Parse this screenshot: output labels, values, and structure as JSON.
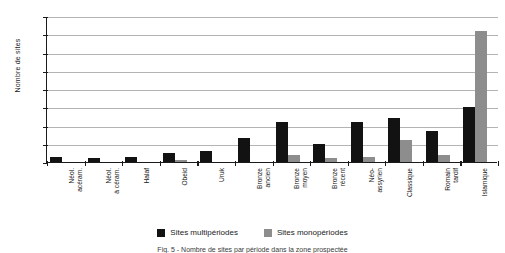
{
  "chart_data": {
    "type": "bar",
    "title": "",
    "xlabel": "",
    "ylabel": "Nombre de sites",
    "ylim": [
      0,
      80
    ],
    "ytick_step": 10,
    "yticks": [
      80,
      70,
      60,
      50,
      40,
      30,
      20,
      10,
      0
    ],
    "grid": true,
    "legend_position": "bottom",
    "categories": [
      "Néol. acéram.",
      "Néol. à céram.",
      "Halaf",
      "Obeid",
      "Uruk",
      "Bronze ancien",
      "Bronze moyen",
      "Bronze récent",
      "Néo-assyrien",
      "Classique",
      "Romain tardif",
      "Islamique"
    ],
    "category_lines": [
      [
        "Néol.",
        "acéram."
      ],
      [
        "Néol.",
        "à céram."
      ],
      [
        "Halaf"
      ],
      [
        "Obeid"
      ],
      [
        "Uruk"
      ],
      [
        "Bronze",
        "ancien"
      ],
      [
        "Bronze",
        "moyen"
      ],
      [
        "Bronze",
        "récent"
      ],
      [
        "Néo-",
        "assyrien"
      ],
      [
        "Classique"
      ],
      [
        "Romain",
        "tardif"
      ],
      [
        "Islamique"
      ]
    ],
    "series": [
      {
        "name": "Sites multipériodes",
        "color": "#121212",
        "values": [
          3,
          2,
          3,
          5,
          6,
          13,
          22,
          10,
          22,
          24,
          17,
          30
        ]
      },
      {
        "name": "Sites monopériodes",
        "color": "#8d8d8d",
        "values": [
          0,
          0,
          0,
          1,
          0,
          0,
          4,
          2,
          3,
          12,
          4,
          72
        ]
      }
    ]
  },
  "legend": {
    "items": [
      {
        "label": "Sites multipériodes",
        "key": "multi"
      },
      {
        "label": "Sites monopériodes",
        "key": "mono"
      }
    ]
  },
  "caption": {
    "text": "Fig. 5 - Nombre de sites par période dans la zone prospectée"
  },
  "colors": {
    "multi": "#121212",
    "mono": "#8d8d8d",
    "grid": "#b4b4b4",
    "axis": "#1a1a1a",
    "background": "#ffffff"
  }
}
